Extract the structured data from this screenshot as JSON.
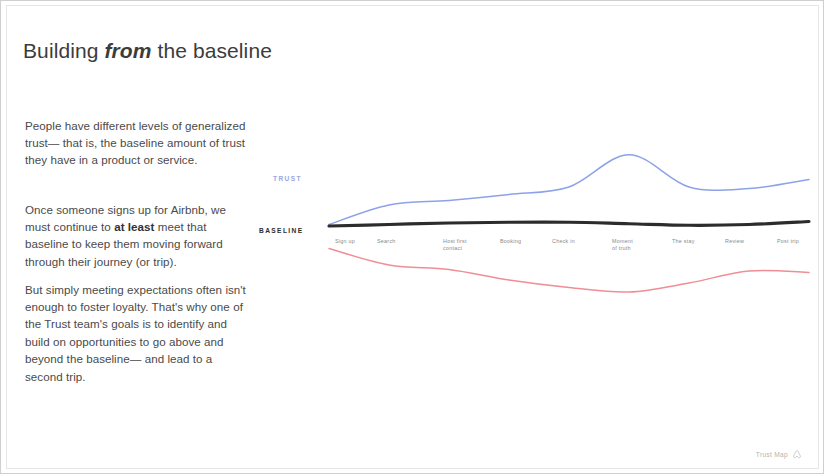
{
  "slide": {
    "headline_part1": "Building ",
    "headline_emphasis": "from",
    "headline_part2": " the baseline",
    "paragraphs": [
      {
        "id": "para-1",
        "text": "People have different levels of generalized trust— that is, the baseline amount of trust they have in a product or service."
      },
      {
        "id": "para-2",
        "pre": "Once someone signs up for Airbnb, we must continue to ",
        "strong": "at least",
        "post": " meet that baseline to keep them moving forward through their journey (or trip)."
      },
      {
        "id": "para-3",
        "text": "But simply meeting expectations often isn't enough to foster loyalty. That's why one of the Trust team's goals is to identify and build on opportunities to go above and beyond the baseline—\nand lead to a second trip."
      }
    ]
  },
  "footer": {
    "label": "Trust Map",
    "icon": "airbnb-belo-icon"
  },
  "chart_data": {
    "type": "line",
    "title": "Building from the baseline",
    "xlabel": "",
    "ylabel": "Trust",
    "grid": false,
    "legend": "inline-axis-labels",
    "axis_labels": {
      "trust": "TRUST",
      "baseline": "BASELINE"
    },
    "colors": {
      "trust_above": "#8da2e8",
      "baseline": "#2e2b2b",
      "trust_below": "#ef8e96"
    },
    "categories": [
      "Sign up",
      "Search",
      "Host first\ncontact",
      "Booking",
      "Check in",
      "Moment\nof truth",
      "The stay",
      "Review",
      "Post trip"
    ],
    "category_x": [
      88,
      130,
      196,
      253,
      305,
      365,
      425,
      478,
      530
    ],
    "x": [
      0,
      1,
      2,
      3,
      4,
      5,
      6,
      7,
      8
    ],
    "ylim": [
      -1.2,
      1.4
    ],
    "series": [
      {
        "name": "Above the baseline",
        "color": "#8da2e8",
        "values": [
          0.02,
          0.28,
          0.34,
          0.42,
          0.52,
          0.95,
          0.52,
          0.5,
          0.62
        ]
      },
      {
        "name": "Baseline",
        "color": "#2e2b2b",
        "values": [
          0.0,
          0.02,
          0.04,
          0.05,
          0.05,
          0.03,
          0.01,
          0.02,
          0.06
        ]
      },
      {
        "name": "Below the baseline",
        "color": "#ef8e96",
        "values": [
          -0.3,
          -0.52,
          -0.58,
          -0.72,
          -0.82,
          -0.88,
          -0.76,
          -0.6,
          -0.62
        ]
      }
    ]
  }
}
